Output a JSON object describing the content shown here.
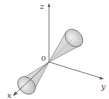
{
  "diagram": {
    "type": "double-cone-3d",
    "axes": {
      "x_label": "x",
      "y_label": "y",
      "z_label": "z",
      "origin_label": "0"
    },
    "colors": {
      "axis": "#555555",
      "cone_fill": "#d4d4d4",
      "cone_edge": "#666666",
      "base_fill": "#c0c0c0"
    }
  }
}
